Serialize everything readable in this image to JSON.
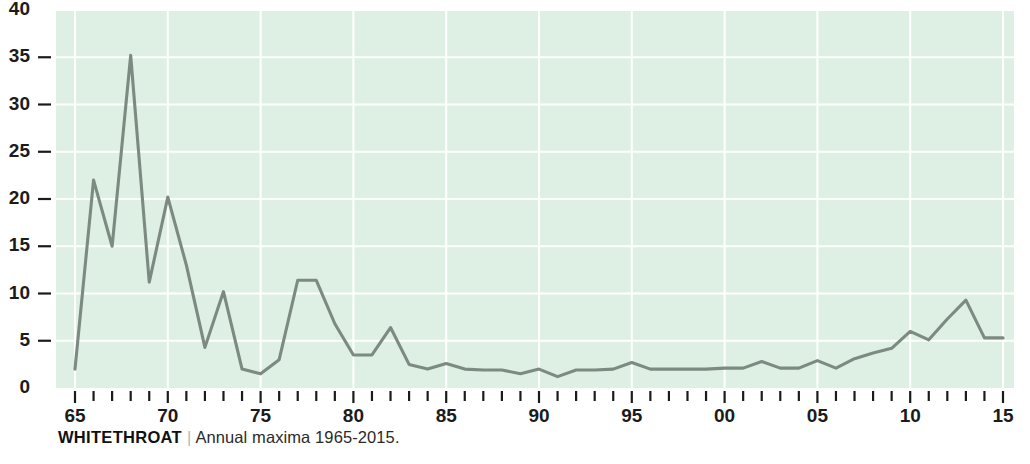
{
  "caption": {
    "title": "WHITETHROAT",
    "separator": "|",
    "description": "Annual maxima 1965-2015."
  },
  "colors": {
    "plot_background": "#ddf0e3",
    "gridline": "#ffffff",
    "series_line": "#7d8a82",
    "text": "#1b1b1b",
    "page_background": "#ffffff"
  },
  "chart_data": {
    "type": "line",
    "title": "WHITETHROAT",
    "subtitle": "Annual maxima 1965-2015.",
    "xlabel": "",
    "ylabel": "",
    "xlim": [
      1965,
      2015
    ],
    "ylim": [
      0,
      40
    ],
    "grid": true,
    "legend_position": "none",
    "y_ticks": [
      0,
      5,
      10,
      15,
      20,
      25,
      30,
      35,
      40
    ],
    "y_tick_labels": [
      "0",
      "5",
      "10",
      "15",
      "20",
      "25",
      "30",
      "35",
      "40"
    ],
    "x_ticks": [
      1965,
      1970,
      1975,
      1980,
      1985,
      1990,
      1995,
      2000,
      2005,
      2010,
      2015
    ],
    "x_tick_labels": [
      "65",
      "70",
      "75",
      "80",
      "85",
      "90",
      "95",
      "00",
      "05",
      "10",
      "15"
    ],
    "x_minor_tick_every": 1,
    "x": [
      1965,
      1966,
      1967,
      1968,
      1969,
      1970,
      1971,
      1972,
      1973,
      1974,
      1975,
      1976,
      1977,
      1978,
      1979,
      1980,
      1981,
      1982,
      1983,
      1984,
      1985,
      1986,
      1987,
      1988,
      1989,
      1990,
      1991,
      1992,
      1993,
      1994,
      1995,
      1996,
      1997,
      1998,
      1999,
      2000,
      2001,
      2002,
      2003,
      2004,
      2005,
      2006,
      2007,
      2008,
      2009,
      2010,
      2011,
      2012,
      2013,
      2014,
      2015
    ],
    "values": [
      2.0,
      22.0,
      15.0,
      35.2,
      11.2,
      20.2,
      13.0,
      4.3,
      10.2,
      2.0,
      1.5,
      3.0,
      11.4,
      11.4,
      6.8,
      3.5,
      3.5,
      6.4,
      2.5,
      2.0,
      2.6,
      2.0,
      1.9,
      1.9,
      1.5,
      2.0,
      1.2,
      1.9,
      1.9,
      2.0,
      2.7,
      2.0,
      2.0,
      2.0,
      2.0,
      2.1,
      2.1,
      2.8,
      2.1,
      2.1,
      2.9,
      2.1,
      3.1,
      3.7,
      4.2,
      6.0,
      5.1,
      7.3,
      9.3,
      5.3,
      5.3
    ],
    "series": [
      {
        "name": "Whitethroat annual maximum",
        "color": "#7d8a82",
        "values": [
          2.0,
          22.0,
          15.0,
          35.2,
          11.2,
          20.2,
          13.0,
          4.3,
          10.2,
          2.0,
          1.5,
          3.0,
          11.4,
          11.4,
          6.8,
          3.5,
          3.5,
          6.4,
          2.5,
          2.0,
          2.6,
          2.0,
          1.9,
          1.9,
          1.5,
          2.0,
          1.2,
          1.9,
          1.9,
          2.0,
          2.7,
          2.0,
          2.0,
          2.0,
          2.0,
          2.1,
          2.1,
          2.8,
          2.1,
          2.1,
          2.9,
          2.1,
          3.1,
          3.7,
          4.2,
          6.0,
          5.1,
          7.3,
          9.3,
          5.3,
          5.3
        ]
      }
    ]
  }
}
